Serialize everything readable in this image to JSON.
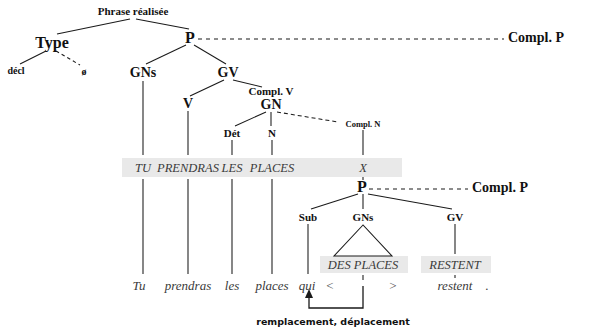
{
  "diagram": {
    "title": "Phrase réalisée",
    "language": "fr",
    "highlight_color": "#e9e9e9",
    "line_color": "#1a1a1a",
    "upper_tree": {
      "root_label": "Phrase réalisée",
      "nodes": [
        {
          "id": "type",
          "label": "Type",
          "x": 52,
          "y": 43
        },
        {
          "id": "decl",
          "label": "décl",
          "x": 16,
          "y": 71
        },
        {
          "id": "zero",
          "label": "ø",
          "x": 84,
          "y": 72
        },
        {
          "id": "p1",
          "label": "P",
          "x": 190,
          "y": 38
        },
        {
          "id": "compl_p1",
          "label": "Compl. P",
          "x": 536,
          "y": 38
        },
        {
          "id": "gns1",
          "label": "GNs",
          "x": 143,
          "y": 73
        },
        {
          "id": "gv1",
          "label": "GV",
          "x": 228,
          "y": 73
        },
        {
          "id": "v1",
          "label": "V",
          "x": 188,
          "y": 104
        },
        {
          "id": "compl_v",
          "label": "Compl. V",
          "x": 271,
          "y": 91
        },
        {
          "id": "gn1",
          "label": "GN",
          "x": 271,
          "y": 105
        },
        {
          "id": "det1",
          "label": "Dét",
          "x": 232,
          "y": 133
        },
        {
          "id": "n1",
          "label": "N",
          "x": 272,
          "y": 133
        },
        {
          "id": "compl_n",
          "label": "Compl. N",
          "x": 363,
          "y": 124
        }
      ]
    },
    "abstract_band": {
      "y": 168,
      "items": [
        {
          "id": "tu-upper",
          "text": "TU",
          "x": 143
        },
        {
          "id": "prendras-upper",
          "text": "PRENDRAS",
          "x": 188
        },
        {
          "id": "les-upper",
          "text": "LES",
          "x": 232
        },
        {
          "id": "places-upper",
          "text": "PLACES",
          "x": 272
        },
        {
          "id": "x-symbol",
          "text": "X",
          "x": 363
        }
      ]
    },
    "lower_tree": {
      "nodes": [
        {
          "id": "p2",
          "label": "P",
          "x": 362,
          "y": 187
        },
        {
          "id": "compl_p2",
          "label": "Compl. P",
          "x": 500,
          "y": 188
        },
        {
          "id": "sub",
          "label": "Sub",
          "x": 308,
          "y": 217
        },
        {
          "id": "gns2",
          "label": "GNs",
          "x": 363,
          "y": 217
        },
        {
          "id": "gv2",
          "label": "GV",
          "x": 455,
          "y": 217
        }
      ],
      "band": {
        "y": 265,
        "items": [
          {
            "id": "des-places-upper",
            "text": "DES PLACES",
            "x": 363
          },
          {
            "id": "restent-upper",
            "text": "RESTENT",
            "x": 455
          }
        ]
      }
    },
    "surface_row": {
      "y": 285,
      "items": [
        {
          "id": "tu",
          "text": "Tu",
          "x": 139
        },
        {
          "id": "prendras",
          "text": "prendras",
          "x": 188
        },
        {
          "id": "les",
          "text": "les",
          "x": 232
        },
        {
          "id": "places",
          "text": "places",
          "x": 272
        },
        {
          "id": "qui",
          "text": "qui",
          "x": 307
        },
        {
          "id": "trace-open",
          "text": "<",
          "x": 330
        },
        {
          "id": "trace-close",
          "text": ">",
          "x": 393
        },
        {
          "id": "restent",
          "text": "restent",
          "x": 455
        },
        {
          "id": "period",
          "text": ".",
          "x": 487
        }
      ]
    },
    "annotation": {
      "label": "remplacement, déplacement",
      "x": 333,
      "y": 322
    }
  }
}
